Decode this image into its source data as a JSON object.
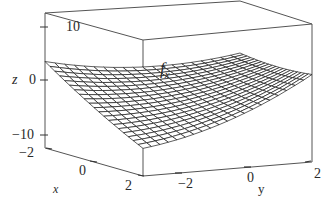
{
  "chart_data": {
    "type": "surface3d",
    "title": "",
    "annotation": "f_x",
    "xlabel": "x",
    "ylabel": "y",
    "zlabel": "z",
    "x_ticks": [
      "-2",
      "0",
      "2"
    ],
    "y_ticks": [
      "-2",
      "0",
      "2"
    ],
    "z_ticks": [
      "10",
      "0",
      "-10"
    ],
    "xlim": [
      -2,
      2
    ],
    "ylim": [
      -2,
      2
    ],
    "zlim": [
      -12,
      12
    ],
    "surface": {
      "description": "wireframe mesh surface, saddle/parabolic shape rising toward x=-2,y=-2 corner and x=2,y=2 corner, dipping toward the front corner",
      "grid_lines": 20,
      "corner_values": {
        "x=-2,y=-2": 8,
        "x=-2,y=2": -1,
        "x=2,y=-2": -1,
        "x=2,y=2": 8,
        "front_corner_min": -10
      }
    },
    "grid": false,
    "box": true
  },
  "labels": {
    "z_axis": "z",
    "x_axis": "x",
    "y_axis": "y",
    "func": "f",
    "func_sub": "x",
    "z_tick_10": "10",
    "z_tick_0": "0",
    "z_tick_m10": "−10",
    "x_tick_m2": "−2",
    "x_tick_0": "0",
    "x_tick_2": "2",
    "y_tick_m2": "−2",
    "y_tick_0": "0",
    "y_tick_2": "2"
  }
}
